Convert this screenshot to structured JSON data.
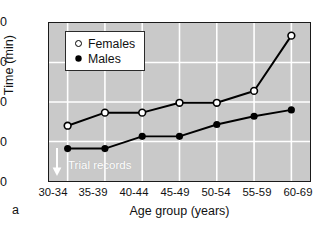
{
  "panel_label": "a",
  "chart_data": {
    "type": "line",
    "title": "",
    "xlabel": "Age group (years)",
    "ylabel": "Time (min)",
    "categories": [
      "30-34",
      "35-39",
      "40-44",
      "45-49",
      "50-54",
      "55-59",
      "60-69"
    ],
    "ylim": [
      40,
      80
    ],
    "yticks": [
      40,
      50,
      60,
      70,
      80
    ],
    "grid": true,
    "legend_position": "upper-left-inside",
    "plot_background": "#c9c9c9",
    "gridline_color": "#ffffff",
    "line_color": "#000000",
    "series": [
      {
        "name": "Females",
        "marker": "open-circle",
        "values": [
          54.0,
          57.3,
          57.3,
          59.8,
          59.8,
          62.8,
          76.8
        ]
      },
      {
        "name": "Males",
        "marker": "filled-circle",
        "values": [
          48.2,
          48.2,
          51.3,
          51.3,
          54.3,
          56.4,
          58.0
        ]
      }
    ],
    "annotations": [
      {
        "text": "Trial records",
        "target_category": "30-34",
        "target_series": "Males",
        "arrow": "down",
        "color": "#ffffff"
      }
    ]
  },
  "legend": {
    "entries": [
      {
        "label": "Females",
        "marker": "open-circle"
      },
      {
        "label": "Males",
        "marker": "filled-circle"
      }
    ]
  }
}
